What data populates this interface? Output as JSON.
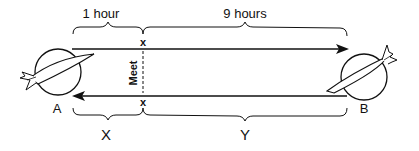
{
  "diagram": {
    "top_labels": {
      "first_segment": "1 hour",
      "second_segment": "9 hours"
    },
    "bottom_labels": {
      "first_segment": "X",
      "second_segment": "Y"
    },
    "endpoints": {
      "left": "A",
      "right": "B"
    },
    "meet_label": "Meet",
    "meet_markers": [
      "x",
      "x"
    ],
    "arrows": [
      {
        "from": "A",
        "to": "B",
        "position": "top"
      },
      {
        "from": "B",
        "to": "A",
        "position": "bottom"
      }
    ],
    "colors": {
      "stroke": "#111111",
      "background": "#ffffff"
    }
  }
}
